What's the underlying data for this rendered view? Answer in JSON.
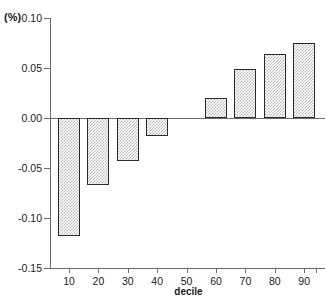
{
  "chart_data": {
    "type": "bar",
    "title": "",
    "subtitle": "",
    "xlabel": "decile",
    "ylabel": "(%)",
    "categories": [
      "10",
      "20",
      "30",
      "40",
      "50",
      "60",
      "70",
      "80",
      "90"
    ],
    "values": [
      -0.118,
      -0.067,
      -0.043,
      -0.018,
      0.0,
      0.02,
      0.049,
      0.064,
      0.075
    ],
    "series": [
      {
        "name": "",
        "values": [
          -0.118,
          -0.067,
          -0.043,
          -0.018,
          0.0,
          0.02,
          0.049,
          0.064,
          0.075
        ]
      }
    ],
    "ylim": [
      -0.15,
      0.1
    ],
    "yticks": [
      0.1,
      0.05,
      0.0,
      -0.05,
      -0.1,
      -0.15
    ],
    "ytick_labels": [
      "0.10",
      "0.05",
      "0.00",
      "-0.05",
      "-0.10",
      "-0.15"
    ],
    "xtick_labels": [
      "10",
      "20",
      "30",
      "40",
      "50",
      "60",
      "70",
      "80",
      "90"
    ],
    "grid": false,
    "legend": null,
    "legend_position": "none",
    "annotations": [],
    "bar_fill": "#b9b9b9",
    "bar_edge": "#2a2a2a",
    "axis_color": "#6d6d6d",
    "background": "#ffffff"
  },
  "axes": {
    "y_unit_label": "(%)",
    "x_axis_title": "decile"
  }
}
